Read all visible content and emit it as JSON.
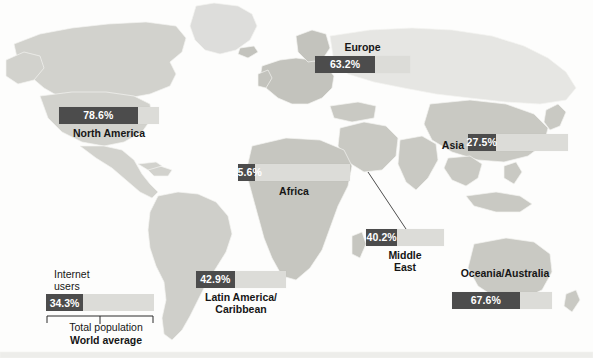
{
  "chart_data": {
    "type": "bar",
    "title": "",
    "xlabel": "",
    "ylabel": "",
    "unit": "percent",
    "encoding": "Each bar is a gauge: the dark segment is the share of internet users, the full light track is the total population (100%).",
    "categories": [
      "North America",
      "Europe",
      "Asia",
      "Africa",
      "Middle East",
      "Latin America/Caribbean",
      "Oceania/Australia",
      "World average"
    ],
    "values": [
      78.6,
      63.2,
      27.5,
      15.6,
      40.2,
      42.9,
      67.6,
      34.3
    ],
    "series": [
      {
        "name": "Internet users",
        "values": [
          78.6,
          63.2,
          27.5,
          15.6,
          40.2,
          42.9,
          67.6,
          34.3
        ]
      },
      {
        "name": "Total population",
        "values": [
          100,
          100,
          100,
          100,
          100,
          100,
          100,
          100
        ]
      }
    ],
    "ylim": [
      0,
      100
    ],
    "grid": false,
    "legend_position": "bottom-left"
  },
  "map": {
    "name": "world-map",
    "ocean_color": "#fdfdfc",
    "land_color": "#d2d2cd",
    "land_color_light": "#e2e2de",
    "land_color_dark": "#b9b9b3",
    "border_color": "#f4f4f1"
  },
  "colors": {
    "bar_fill": "#4c4c4c",
    "bar_track": "#dcdcd8",
    "value_text": "#ffffff",
    "caption_text": "#161616"
  },
  "regions": [
    {
      "id": "north-america",
      "label": "North America",
      "value": "78.6%",
      "percent": 78.6,
      "label_position": "below"
    },
    {
      "id": "europe",
      "label": "Europe",
      "value": "63.2%",
      "percent": 63.2,
      "label_position": "above"
    },
    {
      "id": "asia",
      "label": "Asia",
      "value": "27.5%",
      "percent": 27.5,
      "label_position": "left"
    },
    {
      "id": "africa",
      "label": "Africa",
      "value": "15.6%",
      "percent": 15.6,
      "label_position": "below"
    },
    {
      "id": "middle-east",
      "label_line1": "Middle",
      "label_line2": "East",
      "label": "Middle East",
      "value": "40.2%",
      "percent": 40.2,
      "label_position": "below"
    },
    {
      "id": "latin-america",
      "label_line1": "Latin America/",
      "label_line2": "Caribbean",
      "label": "Latin America/Caribbean",
      "value": "42.9%",
      "percent": 42.9,
      "label_position": "below"
    },
    {
      "id": "oceania",
      "label": "Oceania/Australia",
      "value": "67.6%",
      "percent": 67.6,
      "label_position": "above"
    }
  ],
  "legend": {
    "id": "world-average",
    "title_line1": "Internet",
    "title_line2": "users",
    "value": "34.3%",
    "percent": 34.3,
    "total_label": "Total population",
    "footer": "World average"
  }
}
